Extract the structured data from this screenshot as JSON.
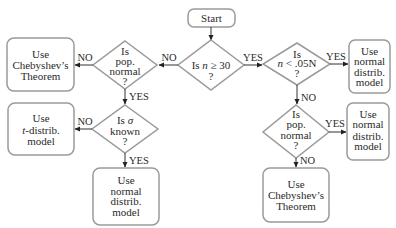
{
  "diagram": {
    "colors": {
      "shape_stroke": "#9a9a9a",
      "arrow": "#333333",
      "text": "#2a2a2a"
    }
  },
  "nodes": {
    "start": {
      "label": "Start"
    },
    "q_sample_size": {
      "prefix": "Is ",
      "var": "n",
      "suffix": " ≥ 30",
      "mark": "?"
    },
    "q_pop_normal_left": {
      "lines": [
        "Is",
        "pop.",
        "normal",
        "?"
      ]
    },
    "q_sigma_known": {
      "prefix": "Is ",
      "var": "σ",
      "line2": "known",
      "mark": "?"
    },
    "q_small_fraction": {
      "line1": "Is",
      "var": "n",
      "suffix": " < .05N",
      "mark": "?"
    },
    "q_pop_normal_right": {
      "lines": [
        "Is",
        "pop.",
        "normal",
        "?"
      ]
    },
    "r_chebyshev_left": {
      "lines": [
        "Use",
        "Chebyshev’s",
        "Theorem"
      ]
    },
    "r_t_model": {
      "line1": "Use",
      "var": "t",
      "suffix": "-distrib.",
      "line3": "model"
    },
    "r_normal_bottom": {
      "lines": [
        "Use",
        "normal",
        "distrib.",
        "model"
      ]
    },
    "r_normal_right_top": {
      "lines": [
        "Use",
        "normal",
        "distrib.",
        "model"
      ]
    },
    "r_normal_right_mid": {
      "lines": [
        "Use",
        "normal",
        "distrib.",
        "model"
      ]
    },
    "r_chebyshev_right": {
      "lines": [
        "Use",
        "Chebyshev’s",
        "Theorem"
      ]
    }
  },
  "edges": {
    "size_no": "NO",
    "size_yes": "YES",
    "left_normal_no": "NO",
    "left_normal_yes": "YES",
    "sigma_no": "NO",
    "sigma_yes": "YES",
    "fraction_yes": "YES",
    "fraction_no": "NO",
    "right_normal_yes": "YES",
    "right_normal_no": "NO"
  }
}
